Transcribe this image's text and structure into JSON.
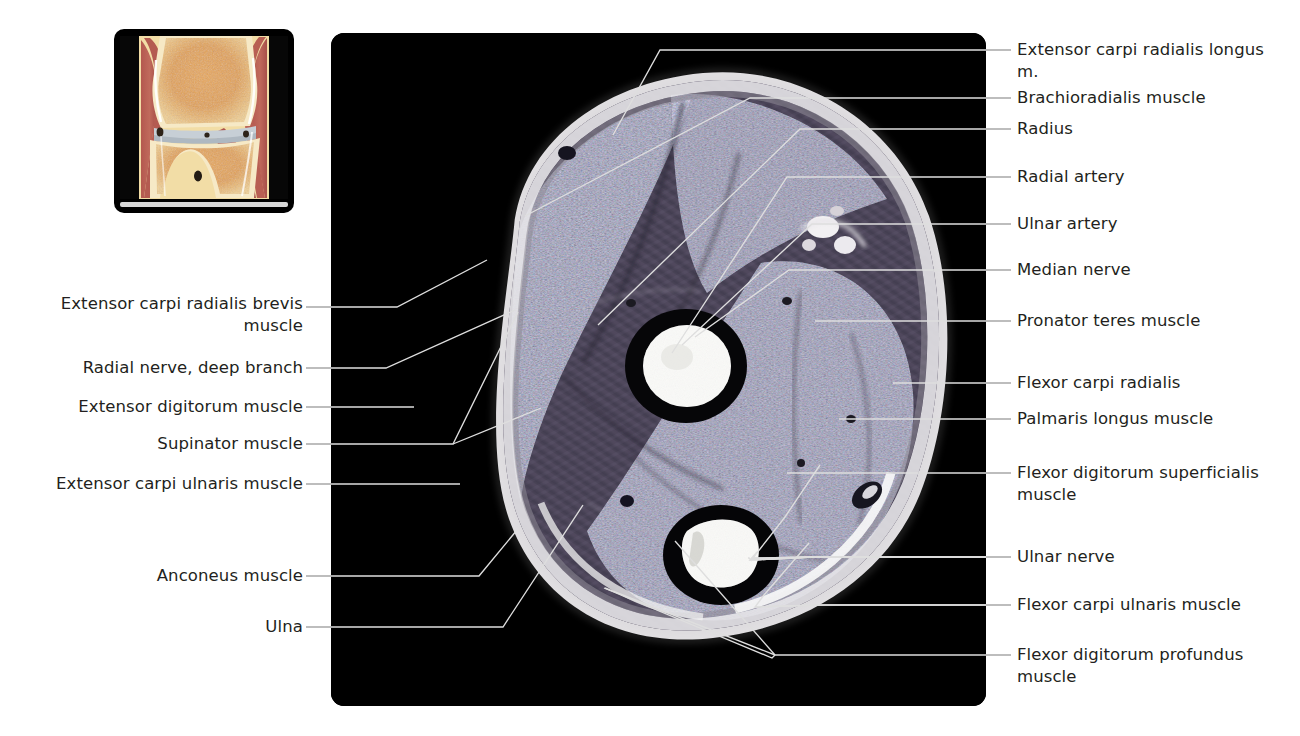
{
  "figure": {
    "type": "anatomical-cross-section-mri",
    "region": "Right forearm, proximal axial (transverse) section",
    "main_image_name": "forearm-axial-mri",
    "thumbnail_name": "elbow-coronal-orientation-thumbnail",
    "colors": {
      "background": "#ffffff",
      "panel": "#000000",
      "leader_line_outside": "#9a9a9a",
      "leader_line_inside": "#e8e8e8",
      "text": "#231f20",
      "bone_bright": "#f4f4f2",
      "fascia": "#dcdcdc",
      "muscle_base": "#4a4356"
    }
  },
  "labels_left": [
    {
      "id": "extensor-carpi-radialis-brevis",
      "text": "Extensor carpi radialis brevis\nmuscle"
    },
    {
      "id": "radial-nerve-deep-branch",
      "text": "Radial nerve, deep branch"
    },
    {
      "id": "extensor-digitorum",
      "text": "Extensor digitorum muscle"
    },
    {
      "id": "supinator",
      "text": "Supinator muscle"
    },
    {
      "id": "extensor-carpi-ulnaris",
      "text": "Extensor carpi ulnaris muscle"
    },
    {
      "id": "anconeus",
      "text": "Anconeus muscle"
    },
    {
      "id": "ulna",
      "text": "Ulna"
    }
  ],
  "labels_right": [
    {
      "id": "extensor-carpi-radialis-longus",
      "text": "Extensor carpi radialis longus\nm."
    },
    {
      "id": "brachioradialis",
      "text": "Brachioradialis muscle"
    },
    {
      "id": "radius",
      "text": "Radius"
    },
    {
      "id": "radial-artery",
      "text": "Radial artery"
    },
    {
      "id": "ulnar-artery",
      "text": "Ulnar artery"
    },
    {
      "id": "median-nerve",
      "text": "Median nerve"
    },
    {
      "id": "pronator-teres",
      "text": "Pronator teres muscle"
    },
    {
      "id": "flexor-carpi-radialis",
      "text": "Flexor carpi radialis"
    },
    {
      "id": "palmaris-longus",
      "text": "Palmaris longus muscle"
    },
    {
      "id": "flexor-digitorum-superficialis",
      "text": "Flexor digitorum superficialis\nmuscle"
    },
    {
      "id": "ulnar-nerve",
      "text": "Ulnar nerve"
    },
    {
      "id": "flexor-carpi-ulnaris",
      "text": "Flexor carpi ulnaris muscle"
    },
    {
      "id": "flexor-digitorum-profundus",
      "text": "Flexor digitorum profundus\nmuscle"
    }
  ]
}
